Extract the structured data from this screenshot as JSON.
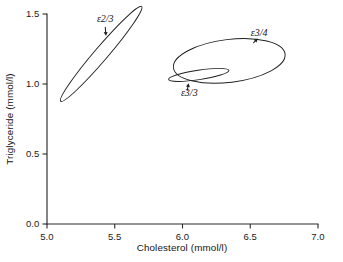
{
  "chart_data": {
    "type": "scatter",
    "title": "",
    "subtitle": "",
    "xlabel": "Cholesterol  (mmol/l)",
    "ylabel": "Triglyceride  (mmol/l)",
    "xlim": [
      5.0,
      7.0
    ],
    "ylim": [
      0.0,
      1.5
    ],
    "xticks": [
      "5.0",
      "5.5",
      "6.0",
      "6.5",
      "7.0"
    ],
    "xtick_values": [
      5.0,
      5.5,
      6.0,
      6.5,
      7.0
    ],
    "yticks": [
      "0.0",
      "0.5",
      "1.0",
      "1.5"
    ],
    "ytick_values": [
      0.0,
      0.5,
      1.0,
      1.5
    ],
    "grid": false,
    "legend": "none",
    "annotations_note": "Each outline is a bivariate confidence ellipse for one apolipoprotein E genotype group, annotated with an italic epsilon label and a pointer arrow.",
    "ellipses": [
      {
        "name": "e2/3",
        "label": "ε2/3",
        "center_x": 5.4,
        "center_y": 1.215,
        "semi_major": 0.46,
        "semi_minor": 0.048,
        "angle_deg": -49.5,
        "x_range": [
          5.12,
          5.68
        ],
        "y_range": [
          0.93,
          1.51
        ],
        "label_x": 5.43,
        "label_y": 1.44,
        "arrow_from_x": 5.43,
        "arrow_from_y": 1.405,
        "arrow_to_x": 5.435,
        "arrow_to_y": 1.345,
        "arrow_dir": "down"
      },
      {
        "name": "e3/4",
        "label": "ε3/4",
        "center_x": 6.345,
        "center_y": 1.165,
        "semi_major": 0.415,
        "semi_minor": 0.153,
        "angle_deg": -7.0,
        "x_range": [
          5.945,
          6.775
        ],
        "y_range": [
          1.015,
          1.305
        ],
        "label_x": 6.565,
        "label_y": 1.345,
        "arrow_from_x": 6.525,
        "arrow_from_y": 1.295,
        "arrow_to_x": 6.555,
        "arrow_to_y": 1.325,
        "arrow_dir": "up"
      },
      {
        "name": "e3/3",
        "label": "ε3/3",
        "center_x": 6.12,
        "center_y": 1.065,
        "semi_major": 0.225,
        "semi_minor": 0.034,
        "angle_deg": -8.5,
        "x_range": [
          5.9,
          6.345
        ],
        "y_range": [
          1.005,
          1.125
        ],
        "label_x": 6.05,
        "label_y": 0.915,
        "arrow_from_x": 6.035,
        "arrow_from_y": 0.955,
        "arrow_to_x": 6.045,
        "arrow_to_y": 1.005,
        "arrow_dir": "up"
      }
    ]
  },
  "axes": {
    "x_axis_name": "cholesterol-axis",
    "y_axis_name": "triglyceride-axis"
  }
}
